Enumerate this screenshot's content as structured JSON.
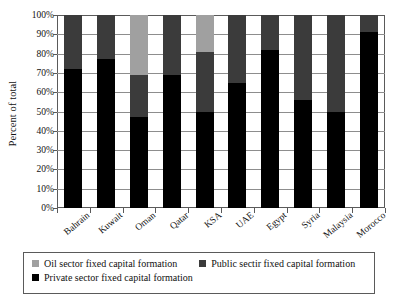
{
  "chart_data": {
    "type": "bar",
    "stacked": true,
    "title": "",
    "xlabel": "",
    "ylabel": "Percent of total",
    "ylim": [
      0,
      100
    ],
    "ytick_labels": [
      "100%",
      "90%",
      "80%",
      "70%",
      "60%",
      "50%",
      "40%",
      "30%",
      "20%",
      "10%",
      "0%"
    ],
    "ytick_values": [
      100,
      90,
      80,
      70,
      60,
      50,
      40,
      30,
      20,
      10,
      0
    ],
    "grid": true,
    "legend_position": "bottom",
    "categories": [
      "Bahrain",
      "Kuwait",
      "Oman",
      "Qatar",
      "KSA",
      "UAE",
      "Egypt",
      "Syria",
      "Malaysia",
      "Morocco"
    ],
    "series": [
      {
        "name": "Private sector fixed capital formation",
        "color": "#000000",
        "values": [
          72,
          77,
          47,
          69,
          50,
          65,
          82,
          56,
          50,
          91
        ]
      },
      {
        "name": "Public sectir fixed capital formation",
        "color": "#3b3b3b",
        "values": [
          28,
          23,
          22,
          31,
          31,
          35,
          18,
          44,
          50,
          9
        ]
      },
      {
        "name": "Oil sector fixed capital formation",
        "color": "#a0a0a0",
        "values": [
          0,
          0,
          31,
          0,
          19,
          0,
          0,
          0,
          0,
          0
        ]
      }
    ]
  },
  "legend": {
    "items": [
      {
        "label": "Oil sector fixed capital formation",
        "color": "#a0a0a0"
      },
      {
        "label": "Public sectir fixed capital formation",
        "color": "#3b3b3b"
      },
      {
        "label": "Private sector fixed capital formation",
        "color": "#000000"
      }
    ]
  }
}
